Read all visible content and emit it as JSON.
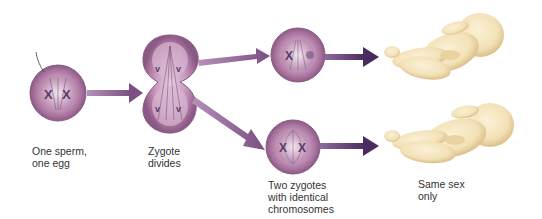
{
  "colors": {
    "cell_fill": "#a6709a",
    "cell_inner": "#c89ac0",
    "cell_edge": "#8a5a84",
    "arrow": "#7b4f82",
    "arrow_dark": "#4a2c5e",
    "baby_skin": "#f3e2b8",
    "baby_shadow": "#e2c690"
  },
  "stages": [
    {
      "id": "fertilization",
      "label_line1": "One sperm,",
      "label_line2": "one egg"
    },
    {
      "id": "zygote-divides",
      "label_line1": "Zygote",
      "label_line2": "divides"
    },
    {
      "id": "two-zygotes",
      "label_line1": "Two zygotes",
      "label_line2": "with identical",
      "label_line3": "chromosomes"
    },
    {
      "id": "result",
      "label_line1": "Same sex",
      "label_line2": "only"
    }
  ]
}
